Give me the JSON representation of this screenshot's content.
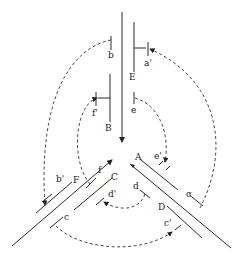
{
  "diagram": {
    "type": "three-way DNA junction schematic",
    "labels": {
      "E": "E",
      "a_prime": "a'",
      "b": "b",
      "B": "B",
      "f_prime": "f'",
      "e": "e",
      "A": "A",
      "e_prime": "e'",
      "alpha": "α",
      "D": "D",
      "c_prime": "c'",
      "d": "d",
      "C": "C",
      "d_prime": "d'",
      "F": "F",
      "b_prime": "b'",
      "f": "f",
      "c": "c"
    },
    "colors": {
      "line": "#2a2a2a",
      "background": "#ffffff"
    }
  }
}
